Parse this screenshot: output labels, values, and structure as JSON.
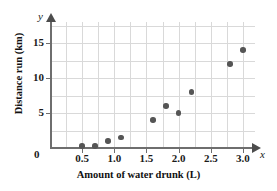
{
  "chart_data": {
    "type": "scatter",
    "title": "",
    "xlabel": "Amount of water drunk (L)",
    "ylabel": "Distance run (km)",
    "x_var_symbol": "x",
    "y_var_symbol": "y",
    "origin_label": "0",
    "xlim": [
      0,
      3.18
    ],
    "ylim": [
      0,
      18
    ],
    "x_ticks": [
      0.5,
      1.0,
      1.5,
      2.0,
      2.5,
      3.0
    ],
    "x_ticklabels": [
      "0.5",
      "1.0",
      "1.5",
      "2.0",
      "2.5",
      "3.0"
    ],
    "y_ticks": [
      5,
      10,
      15
    ],
    "y_ticklabels": [
      "5",
      "10",
      "15"
    ],
    "x_gridlines": [
      0.25,
      0.5,
      0.75,
      1.0,
      1.25,
      1.5,
      1.75,
      2.0,
      2.25,
      2.5,
      2.75,
      3.0
    ],
    "y_gridlines": [
      2.5,
      5,
      7.5,
      10,
      12.5,
      15,
      17.5
    ],
    "grid": true,
    "legend": false,
    "points": [
      {
        "x": 0.5,
        "y": 0.3
      },
      {
        "x": 0.7,
        "y": 0.3
      },
      {
        "x": 0.9,
        "y": 1.0
      },
      {
        "x": 1.1,
        "y": 1.5
      },
      {
        "x": 1.6,
        "y": 4.0
      },
      {
        "x": 1.8,
        "y": 6.0
      },
      {
        "x": 2.0,
        "y": 5.0
      },
      {
        "x": 2.2,
        "y": 8.0
      },
      {
        "x": 2.8,
        "y": 12.0
      },
      {
        "x": 3.0,
        "y": 14.0
      }
    ],
    "marker_color": "#555555",
    "grid_color": "#d9d9d9",
    "axis_color": "#6e6e6e"
  }
}
